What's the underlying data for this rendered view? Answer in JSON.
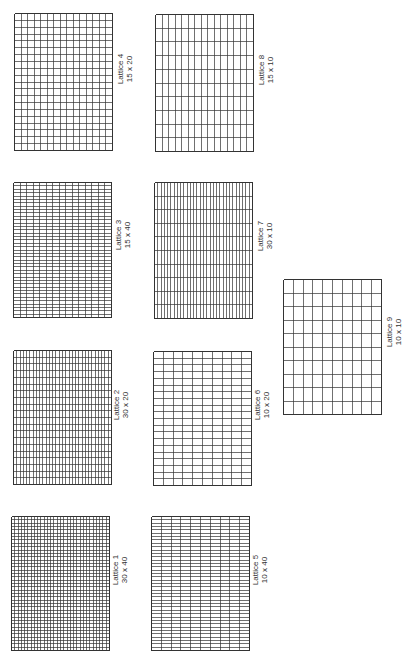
{
  "figure": {
    "orientation": "rotated-90",
    "line_color": "#333333",
    "background": "#ffffff"
  },
  "lattices": [
    {
      "id": 4,
      "title": "Lattice 4",
      "dims": "15 x 20",
      "cols": 15,
      "rows": 20,
      "box": [
        14,
        13,
        98,
        137
      ],
      "label_pos": [
        116,
        99
      ]
    },
    {
      "id": 8,
      "title": "Lattice 8",
      "dims": "15 x 10",
      "cols": 15,
      "rows": 10,
      "box": [
        155,
        14,
        98,
        137
      ],
      "label_pos": [
        257,
        100
      ]
    },
    {
      "id": 3,
      "title": "Lattice 3",
      "dims": "15 x 40",
      "cols": 15,
      "rows": 40,
      "box": [
        13,
        182,
        98,
        135
      ],
      "label_pos": [
        114,
        265
      ]
    },
    {
      "id": 7,
      "title": "Lattice 7",
      "dims": "30 x 10",
      "cols": 30,
      "rows": 10,
      "box": [
        154,
        182,
        98,
        136
      ],
      "label_pos": [
        256,
        266
      ]
    },
    {
      "id": 9,
      "title": "Lattice 9",
      "dims": "10 x 10",
      "cols": 10,
      "rows": 10,
      "box": [
        283,
        279,
        98,
        135
      ],
      "label_pos": [
        385,
        362
      ]
    },
    {
      "id": 2,
      "title": "Lattice 2",
      "dims": "30 x 20",
      "cols": 30,
      "rows": 20,
      "box": [
        13,
        350,
        98,
        134
      ],
      "label_pos": [
        112,
        435
      ]
    },
    {
      "id": 6,
      "title": "Lattice 6",
      "dims": "10 x 20",
      "cols": 10,
      "rows": 20,
      "box": [
        153,
        351,
        98,
        134
      ],
      "label_pos": [
        253,
        435
      ]
    },
    {
      "id": 1,
      "title": "Lattice 1",
      "dims": "30 x 40",
      "cols": 30,
      "rows": 40,
      "box": [
        11,
        516,
        98,
        134
      ],
      "label_pos": [
        111,
        600
      ]
    },
    {
      "id": 5,
      "title": "Lattice 5",
      "dims": "10 x 40",
      "cols": 10,
      "rows": 40,
      "box": [
        151,
        516,
        98,
        134
      ],
      "label_pos": [
        251,
        600
      ]
    }
  ]
}
